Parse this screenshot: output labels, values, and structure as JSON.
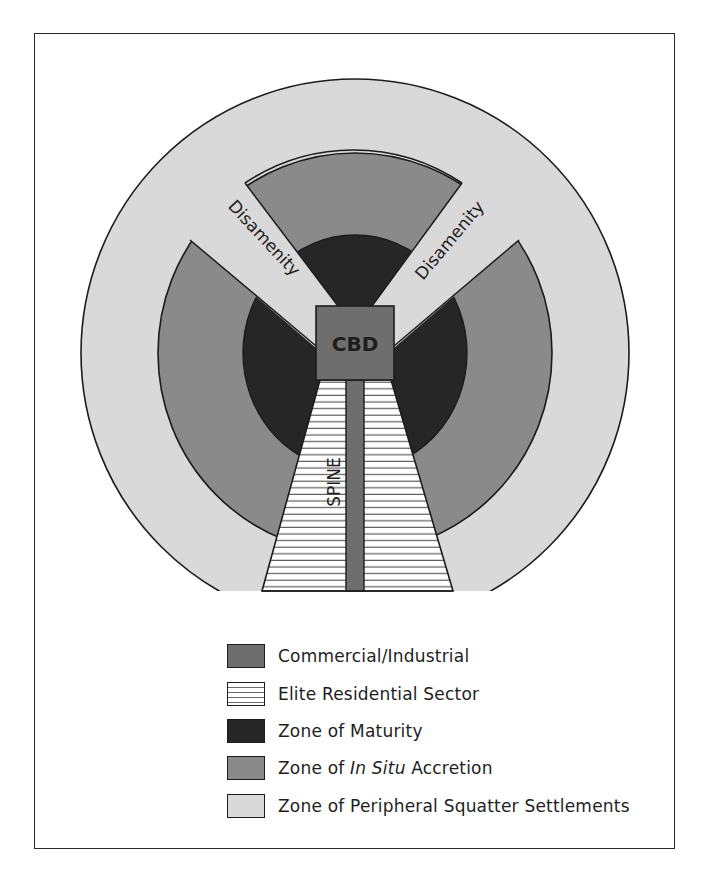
{
  "diagram": {
    "type": "urban-structure-model",
    "labels": {
      "cbd": "CBD",
      "spine": "SPINE",
      "disamenity_left": "Disamenity",
      "disamenity_right": "Disamenity"
    },
    "colors": {
      "commercial_industrial": "#6e6e6e",
      "elite_residential_fill": "#ffffff",
      "elite_residential_hatch": "#6a6a6a",
      "zone_of_maturity": "#262626",
      "zone_of_in_situ_accretion": "#8a8a8a",
      "zone_of_peripheral_squatter": "#d9d9d9",
      "outline": "#1c1c1c"
    }
  },
  "legend": {
    "items": [
      {
        "swatch": "commercial_industrial",
        "label": "Commercial/Industrial"
      },
      {
        "swatch": "elite_residential",
        "label": "Elite Residential Sector"
      },
      {
        "swatch": "zone_of_maturity",
        "label": "Zone of Maturity"
      },
      {
        "swatch": "zone_of_in_situ_accretion",
        "label_prefix": "Zone of ",
        "label_italic": "In Situ",
        "label_suffix": " Accretion"
      },
      {
        "swatch": "zone_of_peripheral_squatter",
        "label": "Zone of Peripheral Squatter Settlements"
      }
    ]
  }
}
